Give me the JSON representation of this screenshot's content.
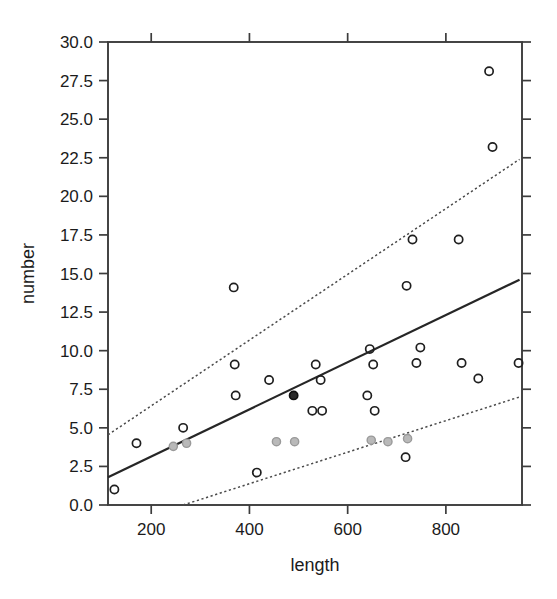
{
  "chart_data": {
    "type": "scatter",
    "title": "",
    "xlabel": "length",
    "ylabel": "number",
    "xlim": [
      112,
      955
    ],
    "ylim": [
      0.0,
      30.0
    ],
    "grid": false,
    "legend": null,
    "xticks": [
      200,
      400,
      600,
      800
    ],
    "xtick_labels": [
      "200",
      "400",
      "600",
      "800"
    ],
    "yticks": [
      0.0,
      2.5,
      5.0,
      7.5,
      10.0,
      12.5,
      15.0,
      17.5,
      20.0,
      22.5,
      25.0,
      27.5,
      30.0
    ],
    "ytick_labels": [
      "0.0",
      "2.5",
      "5.0",
      "7.5",
      "10.0",
      "12.5",
      "15.0",
      "17.5",
      "20.0",
      "22.5",
      "25.0",
      "27.5",
      "30.0"
    ],
    "points": [
      {
        "x": 125,
        "y": 1.0,
        "style": "open"
      },
      {
        "x": 170,
        "y": 4.0,
        "style": "open"
      },
      {
        "x": 245,
        "y": 3.8,
        "style": "faded"
      },
      {
        "x": 265,
        "y": 5.0,
        "style": "open"
      },
      {
        "x": 272,
        "y": 4.0,
        "style": "faded"
      },
      {
        "x": 368,
        "y": 14.1,
        "style": "open"
      },
      {
        "x": 370,
        "y": 9.1,
        "style": "open"
      },
      {
        "x": 372,
        "y": 7.1,
        "style": "open"
      },
      {
        "x": 415,
        "y": 2.1,
        "style": "open"
      },
      {
        "x": 440,
        "y": 8.1,
        "style": "open"
      },
      {
        "x": 455,
        "y": 4.1,
        "style": "faded"
      },
      {
        "x": 490,
        "y": 7.1,
        "style": "dark"
      },
      {
        "x": 492,
        "y": 4.1,
        "style": "faded"
      },
      {
        "x": 528,
        "y": 6.1,
        "style": "open"
      },
      {
        "x": 535,
        "y": 9.1,
        "style": "open"
      },
      {
        "x": 545,
        "y": 8.1,
        "style": "open"
      },
      {
        "x": 548,
        "y": 6.1,
        "style": "open"
      },
      {
        "x": 640,
        "y": 7.1,
        "style": "open"
      },
      {
        "x": 645,
        "y": 10.1,
        "style": "open"
      },
      {
        "x": 648,
        "y": 4.2,
        "style": "faded"
      },
      {
        "x": 652,
        "y": 9.1,
        "style": "open"
      },
      {
        "x": 655,
        "y": 6.1,
        "style": "open"
      },
      {
        "x": 682,
        "y": 4.1,
        "style": "faded"
      },
      {
        "x": 718,
        "y": 3.1,
        "style": "open"
      },
      {
        "x": 720,
        "y": 14.2,
        "style": "open"
      },
      {
        "x": 722,
        "y": 4.3,
        "style": "faded"
      },
      {
        "x": 732,
        "y": 17.2,
        "style": "open"
      },
      {
        "x": 740,
        "y": 9.2,
        "style": "open"
      },
      {
        "x": 748,
        "y": 10.2,
        "style": "open"
      },
      {
        "x": 826,
        "y": 17.2,
        "style": "open"
      },
      {
        "x": 832,
        "y": 9.2,
        "style": "open"
      },
      {
        "x": 866,
        "y": 8.2,
        "style": "open"
      },
      {
        "x": 888,
        "y": 28.1,
        "style": "open"
      },
      {
        "x": 895,
        "y": 23.2,
        "style": "open"
      },
      {
        "x": 948,
        "y": 9.2,
        "style": "open"
      }
    ],
    "fit_line": {
      "name": "regression-fit",
      "style": "solid",
      "x0": 112,
      "y0": 1.8,
      "x1": 950,
      "y1": 14.6
    },
    "upper_band": {
      "name": "upper-confidence-band",
      "style": "dotted",
      "x0": 112,
      "y0": 4.55,
      "x1": 950,
      "y1": 22.4
    },
    "lower_band": {
      "name": "lower-confidence-band",
      "style": "dotted",
      "x0": 265,
      "y0": 0.0,
      "x1": 950,
      "y1": 7.0
    }
  }
}
